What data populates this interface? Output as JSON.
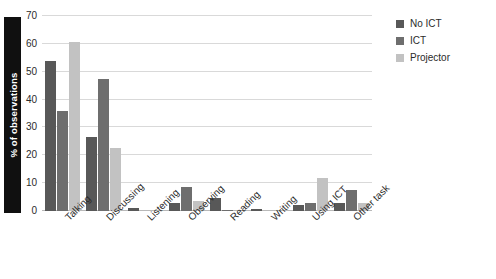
{
  "chart_data": {
    "type": "bar",
    "title": "",
    "subtitle": "",
    "xlabel": "",
    "ylabel": "% of observations",
    "ylim": [
      0,
      70
    ],
    "yticks": [
      0,
      10,
      20,
      30,
      40,
      50,
      60,
      70
    ],
    "ytick_labels": [
      "0",
      "10",
      "20",
      "30",
      "40",
      "50",
      "60",
      "70"
    ],
    "grid": true,
    "legend_position": "right-top",
    "categories": [
      "Talking",
      "Discussing",
      "Listening",
      "Observing",
      "Reading",
      "Writing",
      "Using ICT",
      "Other task"
    ],
    "series": [
      {
        "name": "No ICT",
        "color": "#585858",
        "values": [
          54,
          26.5,
          1,
          3,
          4.5,
          0.8,
          2,
          3
        ]
      },
      {
        "name": "ICT",
        "color": "#6e6e6e",
        "values": [
          36,
          47.5,
          0,
          8.5,
          0.5,
          0,
          3,
          7.5
        ]
      },
      {
        "name": "Projector",
        "color": "#c2c2c2",
        "values": [
          60.5,
          22.5,
          0,
          3.5,
          0,
          0,
          12,
          3
        ]
      }
    ]
  },
  "axis": {
    "y_label_text": "% of observations",
    "y_label_background": "#101010",
    "y_label_color": "#ffffff"
  },
  "legend": {
    "items": [
      {
        "label": "No ICT",
        "color": "#585858"
      },
      {
        "label": "ICT",
        "color": "#6e6e6e"
      },
      {
        "label": "Projector",
        "color": "#c2c2c2"
      }
    ]
  }
}
